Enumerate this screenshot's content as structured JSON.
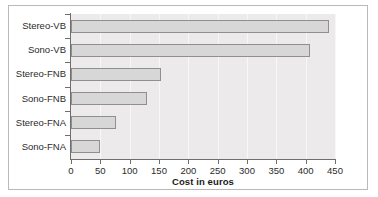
{
  "chart_data": {
    "type": "bar",
    "orientation": "horizontal",
    "title": "",
    "xlabel": "Cost in euros",
    "ylabel": "",
    "categories": [
      "Sono-FNA",
      "Stereo-FNA",
      "Sono-FNB",
      "Stereo-FNB",
      "Sono-VB",
      "Stereo-VB"
    ],
    "values": [
      50,
      77,
      130,
      153,
      408,
      440
    ],
    "xlim": [
      0,
      450
    ],
    "xticks": [
      0,
      50,
      100,
      150,
      200,
      250,
      300,
      350,
      400,
      450
    ],
    "xtick_labels": [
      "0",
      "50",
      "100",
      "150",
      "200",
      "250",
      "300",
      "350",
      "400",
      "450"
    ],
    "grid": true,
    "legend": false,
    "bar_fill_color": "#d7d7d7",
    "bar_edge_color": "#8f8f8f",
    "plot_background_color": "#eceaea",
    "axis_color": "#6e6e6e",
    "figure_background_color": "#ffffff"
  }
}
